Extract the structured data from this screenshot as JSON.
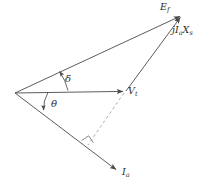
{
  "diagram": {
    "type": "phasor-diagram",
    "title_visible": false,
    "background_color": "#ffffff",
    "stroke_color": "#4a4a4a",
    "dashed_color": "#9a9a9a",
    "labels": {
      "ef": "E",
      "ef_sub": "f",
      "jiaxs_j": "j",
      "jiaxs_i": "I",
      "jiaxs_i_sub": "a",
      "jiaxs_x": "X",
      "jiaxs_x_sub": "s",
      "vt": "V",
      "vt_sub": "t",
      "ia": "I",
      "ia_sub": "a",
      "delta": "δ",
      "theta": "θ"
    },
    "vectors": [
      {
        "name": "ef",
        "label": "Ef",
        "from": [
          15,
          93
        ],
        "to": [
          182,
          15
        ],
        "arrow": true
      },
      {
        "name": "vt",
        "label": "Vt",
        "from": [
          15,
          93
        ],
        "to": [
          126,
          91
        ],
        "arrow": true
      },
      {
        "name": "ia",
        "label": "Ia",
        "from": [
          15,
          93
        ],
        "to": [
          119,
          172
        ],
        "arrow": true
      },
      {
        "name": "jiaxs",
        "label": "jIaXs",
        "from": [
          126,
          91
        ],
        "to": [
          182,
          15
        ],
        "arrow": true
      }
    ],
    "dashed_line": {
      "name": "projection",
      "from": [
        126,
        91
      ],
      "to": [
        87,
        147
      ]
    },
    "right_angle_marker": {
      "at": [
        87,
        147
      ],
      "size": 9
    },
    "angles": [
      {
        "name": "delta",
        "symbol": "δ",
        "between": [
          "vt",
          "ef"
        ],
        "vertex": [
          15,
          93
        ],
        "radius": 53
      },
      {
        "name": "theta",
        "symbol": "θ",
        "between": [
          "vt",
          "ia"
        ],
        "vertex": [
          15,
          93
        ],
        "radius": 33
      }
    ]
  }
}
